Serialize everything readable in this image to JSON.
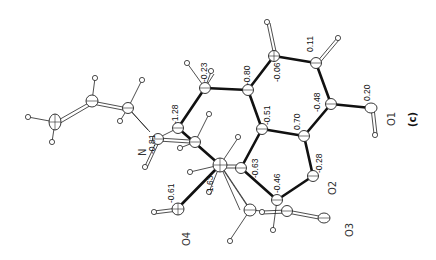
{
  "figure": {
    "panel_label": "(c)",
    "orientation": "rotated -90deg"
  },
  "atom_labels": {
    "N": "N",
    "O1": "O1",
    "O2": "O2",
    "O3": "O3",
    "O4": "O4"
  },
  "charges": {
    "c_top_left": "-0.23",
    "c_left": "-1.28",
    "c_ring_top": "-0.80",
    "c_ring_top2": "-0.06",
    "c_ring_right": "0.11",
    "c_center": "-0.51",
    "c_mid": "0.70",
    "c_right": "-0.48",
    "o1": "0.20",
    "n": "-0.81",
    "c_lower_mid": "-0.63",
    "c_lower": "-1.63",
    "o4": "-0.61",
    "c_bottom": "-0.46",
    "o2": "-0.28"
  }
}
